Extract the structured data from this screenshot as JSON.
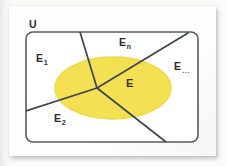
{
  "figure": {
    "type": "venn-partition-diagram",
    "universal_set_label": "U",
    "highlighted_set_label": "E",
    "colors": {
      "highlight_fill": "#f4e04d",
      "highlight_stroke": "#ecd93f",
      "partition_line": "#3d4450",
      "boundary": "#58595b",
      "label_text": "#2b2b2b",
      "card_background": "#fefefe",
      "page_background": "#f7f7f5"
    },
    "labels": [
      {
        "id": "U",
        "base": "U",
        "sub": "",
        "ellipsis": false
      },
      {
        "id": "E1",
        "base": "E",
        "sub": "1",
        "ellipsis": false
      },
      {
        "id": "E2",
        "base": "E",
        "sub": "2",
        "ellipsis": false
      },
      {
        "id": "En",
        "base": "E",
        "sub": "n",
        "ellipsis": false
      },
      {
        "id": "Edots",
        "base": "E",
        "sub": "",
        "ellipsis": true
      },
      {
        "id": "Einner",
        "base": "E",
        "sub": "",
        "ellipsis": false
      }
    ],
    "regions": [
      "E1",
      "E2",
      "En",
      "E..."
    ],
    "description_text": {
      "universal": "U",
      "e_one": "E",
      "e_one_sub": "1",
      "e_two": "E",
      "e_two_sub": "2",
      "e_n": "E",
      "e_n_sub": "n",
      "e_dots": "E",
      "e_dots_sub": "...",
      "e_event": "E"
    }
  }
}
